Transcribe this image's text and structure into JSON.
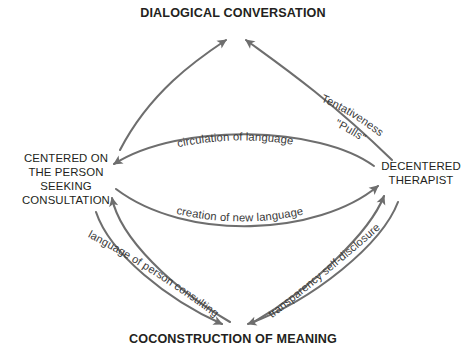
{
  "diagram": {
    "type": "cycle-diagram",
    "background_color": "#ffffff",
    "stroke_color": "#6e6e6e",
    "text_color": "#231f20",
    "label_color": "#3a3a3a",
    "nodes": {
      "top": "DIALOGICAL CONVERSATION",
      "bottom": "COCONSTRUCTION OF MEANING",
      "left": "CENTERED ON\nTHE PERSON SEEKING\nCONSULTATION",
      "right": "DECENTERED\nTHERAPIST"
    },
    "edge_labels": {
      "tentativeness": "Tentativeness",
      "pulls": "\"Pulls\"",
      "circulation": "circulation of language",
      "creation": "creation of new language",
      "language_of_person": "language of person consulting",
      "transparency": "transparency self-disclosure"
    },
    "edges": [
      {
        "name": "left-to-top",
        "from": "left",
        "to": "top",
        "label": ""
      },
      {
        "name": "right-to-top",
        "from": "right",
        "to": "top",
        "label": "Tentativeness \"Pulls\""
      },
      {
        "name": "right-to-left",
        "from": "right",
        "to": "left",
        "label": "circulation of language"
      },
      {
        "name": "left-to-right",
        "from": "left",
        "to": "right",
        "label": "creation of new language"
      },
      {
        "name": "bottom-to-left",
        "from": "bottom",
        "to": "left",
        "label": "language of person consulting"
      },
      {
        "name": "bottom-to-right",
        "from": "bottom",
        "to": "right",
        "label": "transparency self-disclosure"
      },
      {
        "name": "left-to-bottom",
        "from": "left",
        "to": "bottom",
        "label": ""
      },
      {
        "name": "right-to-bottom",
        "from": "right",
        "to": "bottom",
        "label": ""
      }
    ]
  }
}
